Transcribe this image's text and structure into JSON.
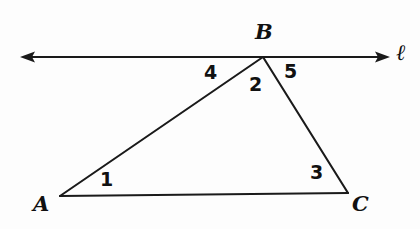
{
  "figure": {
    "kind": "geometry-diagram",
    "width": 420,
    "height": 229,
    "background_color": "#fdfdfd",
    "ink_color": "#1a1a1a"
  },
  "line": {
    "label": "ℓ",
    "name": "line-l",
    "y": 57,
    "x_start": 20,
    "x_end": 390,
    "arrows": "both",
    "label_x": 402,
    "label_y": 57
  },
  "triangle": {
    "name": "triangle-ABC",
    "vertices": [
      {
        "name": "A",
        "label": "A",
        "x": 60,
        "y": 196,
        "label_x": 42,
        "label_y": 208
      },
      {
        "name": "B",
        "label": "B",
        "x": 263,
        "y": 57,
        "label_x": 263,
        "label_y": 35
      },
      {
        "name": "C",
        "label": "C",
        "x": 348,
        "y": 193,
        "label_x": 360,
        "label_y": 208
      }
    ],
    "sides": [
      {
        "name": "side-AB",
        "from": "A",
        "to": "B"
      },
      {
        "name": "side-BC",
        "from": "B",
        "to": "C"
      },
      {
        "name": "side-AC",
        "from": "A",
        "to": "C"
      }
    ]
  },
  "angles": [
    {
      "id": "1",
      "label": "1",
      "name": "angle-1-at-A",
      "vertex": "A",
      "x": 107,
      "y": 182
    },
    {
      "id": "2",
      "label": "2",
      "name": "angle-2-at-B-interior",
      "vertex": "B",
      "x": 256,
      "y": 87
    },
    {
      "id": "3",
      "label": "3",
      "name": "angle-3-at-C",
      "vertex": "C",
      "x": 317,
      "y": 175
    },
    {
      "id": "4",
      "label": "4",
      "name": "angle-4-at-B-exterior-left",
      "vertex": "B",
      "x": 211,
      "y": 74
    },
    {
      "id": "5",
      "label": "5",
      "name": "angle-5-at-B-exterior-right",
      "vertex": "B",
      "x": 291,
      "y": 74
    }
  ]
}
